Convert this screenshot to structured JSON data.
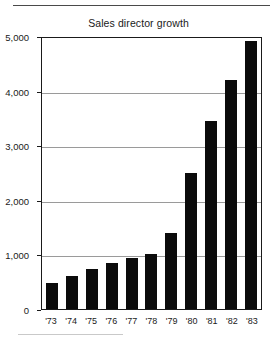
{
  "chart_data": {
    "type": "bar",
    "title": "Sales director growth",
    "xlabel": "",
    "ylabel": "",
    "categories": [
      "'73",
      "'74",
      "'75",
      "'76",
      "'77",
      "'78",
      "'79",
      "'80",
      "'81",
      "'82",
      "'83"
    ],
    "values": [
      480,
      600,
      730,
      840,
      930,
      1000,
      1400,
      2500,
      3450,
      4200,
      4900
    ],
    "ylim": [
      0,
      5000
    ],
    "ytick_values": [
      0,
      1000,
      2000,
      3000,
      4000,
      5000
    ],
    "ytick_labels": [
      "0",
      "1,000",
      "2,000",
      "3,000",
      "4,000",
      "5,000"
    ],
    "grid": true,
    "grid_axis": "y",
    "legend": false,
    "bar_color": "#0b0b0b",
    "axis_color": "#1a1a1a",
    "grid_color": "#9a9a9a",
    "background": "#ffffff"
  },
  "decorations": {
    "top_rule": "horizontal-rule",
    "bottom_rule": "horizontal-rule-partial"
  }
}
